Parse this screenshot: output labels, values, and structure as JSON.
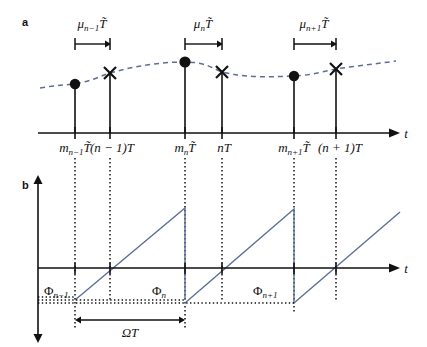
{
  "figure": {
    "width": 427,
    "height": 347,
    "background": "#ffffff",
    "line_color_signal": "#5d6f96",
    "line_color_axis": "#111111"
  },
  "panel_a": {
    "label": "a",
    "axis": {
      "x_axis_label": "t",
      "y_label": "",
      "baseline_y": 133,
      "x_start": 38,
      "x_end": 396
    },
    "tick_labels": [
      {
        "id": "m-n-1",
        "base": "m",
        "sub": "n−1",
        "tail": "T̃",
        "x": 75
      },
      {
        "id": "n-1-T",
        "base": "(n − 1)T",
        "sub": "",
        "tail": "",
        "x": 110
      },
      {
        "id": "m-n",
        "base": "m",
        "sub": "n",
        "tail": "T̃",
        "x": 185
      },
      {
        "id": "n-T",
        "base": "nT",
        "sub": "",
        "tail": "",
        "x": 222
      },
      {
        "id": "m-n+1",
        "base": "m",
        "sub": "n+1",
        "tail": "T̃",
        "x": 294
      },
      {
        "id": "n+1-T",
        "base": "(n + 1)T",
        "sub": "",
        "tail": "",
        "x": 336
      }
    ],
    "interval_annotations": [
      {
        "id": "mu-n-1",
        "base": "μ",
        "sub": "n−1",
        "tail": "T̃",
        "x_from": 75,
        "x_to": 110,
        "label_x": 92,
        "label_y": 28,
        "arrow_y": 44
      },
      {
        "id": "mu-n",
        "base": "μ",
        "sub": "n",
        "tail": "T̃",
        "x_from": 185,
        "x_to": 222,
        "label_x": 203,
        "label_y": 28,
        "arrow_y": 44
      },
      {
        "id": "mu-n+1",
        "base": "μ",
        "sub": "n+1",
        "tail": "T̃",
        "x_from": 294,
        "x_to": 336,
        "label_x": 314,
        "label_y": 28,
        "arrow_y": 44
      }
    ],
    "samples": [
      {
        "type": "dot",
        "x": 75,
        "y": 84
      },
      {
        "type": "cross",
        "x": 110,
        "y": 73
      },
      {
        "type": "dot",
        "x": 185,
        "y": 62
      },
      {
        "type": "cross",
        "x": 222,
        "y": 72
      },
      {
        "type": "dot",
        "x": 294,
        "y": 76
      },
      {
        "type": "cross",
        "x": 336,
        "y": 69
      }
    ],
    "wave_path": "M 40,88 C 58,85 66,85 75,84 C 95,80 100,76 110,73 C 135,66 160,62 185,62 C 205,62 212,68 222,72 C 248,78 270,77 294,76 C 314,75 324,71 336,69 C 355,66 375,64 396,61"
  },
  "panel_b": {
    "label": "b",
    "axis": {
      "x_axis_label": "t",
      "baseline_y": 268,
      "x_start": 38,
      "x_end": 396,
      "y_axis_x": 38,
      "y_top": 178,
      "y_bottom": 340
    },
    "phase_labels": [
      {
        "id": "phi-n-1",
        "base": "Φ",
        "sub": "n−1",
        "x": 44,
        "y": 293
      },
      {
        "id": "phi-n",
        "base": "Φ",
        "sub": "n",
        "x": 152,
        "y": 293
      },
      {
        "id": "phi-n+1",
        "base": "Φ",
        "sub": "n+1",
        "x": 253,
        "y": 293
      },
      {
        "id": "omega-T",
        "base": "ΩT",
        "sub": "",
        "x": 120,
        "y": 333
      }
    ],
    "ramps": [
      {
        "id": "ramp-1",
        "x_start": 75,
        "x_end": 185,
        "y_start": 300,
        "y_peak": 208
      },
      {
        "id": "ramp-2",
        "x_start": 185,
        "x_end": 294,
        "y_start": 303,
        "y_peak": 209
      },
      {
        "id": "ramp-3",
        "x_start": 294,
        "x_end": 400,
        "y_start": 303,
        "y_peak": 212
      }
    ],
    "omega_span": {
      "x_from": 75,
      "x_to": 185,
      "y": 320
    },
    "level_lines": [
      {
        "id": "level-upper",
        "y": 297,
        "x_from": 38,
        "x_to": 75
      },
      {
        "id": "level-phi-n",
        "y": 300,
        "x_from": 38,
        "x_to": 185
      },
      {
        "id": "level-phi-n1",
        "y": 303,
        "x_from": 38,
        "x_to": 294
      }
    ]
  },
  "connectors": {
    "x_positions": [
      75,
      110,
      185,
      222,
      294,
      336
    ],
    "y_from": 138,
    "y_to": 178
  }
}
